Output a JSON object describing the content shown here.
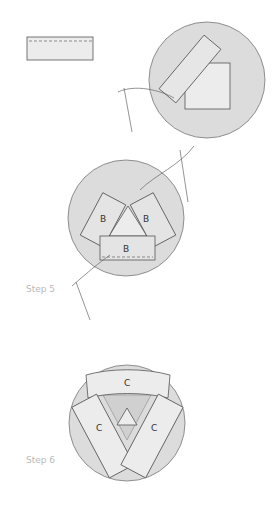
{
  "diagram": {
    "steps": [
      {
        "label": "Step 5"
      },
      {
        "label": "Step 6"
      }
    ],
    "pieces": {
      "b": "B",
      "c": "C"
    },
    "colors": {
      "circle_fill": "#dcdcdc",
      "piece_fill": "#ececec",
      "outline": "#555555",
      "label_gray": "#b8b8b8"
    }
  }
}
